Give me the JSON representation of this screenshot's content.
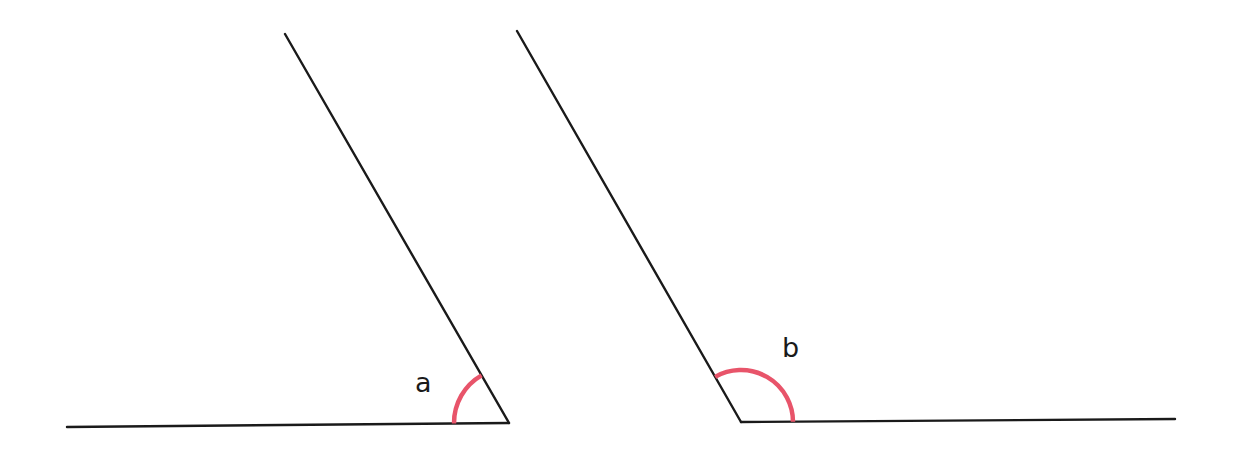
{
  "colors": {
    "background": "#ffffff",
    "line": "#1a1a1a",
    "arc": "#e8546a"
  },
  "angles": [
    {
      "id": "a",
      "label": "a",
      "type": "acute",
      "vertex": [
        509,
        423
      ],
      "ray_horizontal_end": [
        67,
        427
      ],
      "ray_slanted_end": [
        285,
        34
      ],
      "arc_radius": 55,
      "label_pos": [
        415,
        392
      ]
    },
    {
      "id": "b",
      "label": "b",
      "type": "obtuse",
      "vertex": [
        741,
        422
      ],
      "ray_horizontal_end": [
        1175,
        419
      ],
      "ray_slanted_end": [
        517,
        31
      ],
      "arc_radius": 52,
      "label_pos": [
        782,
        357
      ]
    }
  ]
}
